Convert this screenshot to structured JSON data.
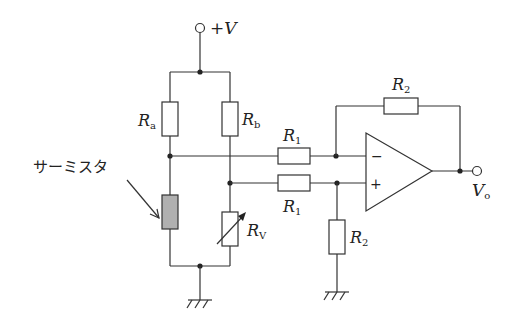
{
  "diagram": {
    "type": "thermistor bridge with differential amplifier",
    "supply": {
      "label": "+V"
    },
    "output": {
      "label_main": "V",
      "label_sub": "o"
    },
    "thermistor": {
      "label": "サーミスタ",
      "fill_color": "#b0b0b0"
    },
    "resistors": {
      "ra": {
        "main": "R",
        "sub": "a"
      },
      "rb": {
        "main": "R",
        "sub": "b"
      },
      "rv": {
        "main": "R",
        "sub": "V"
      },
      "r1_top": {
        "main": "R",
        "sub": "1"
      },
      "r1_bottom": {
        "main": "R",
        "sub": "1"
      },
      "r2_feedback": {
        "main": "R",
        "sub": "2"
      },
      "r2_ground": {
        "main": "R",
        "sub": "2"
      }
    },
    "opamp": {
      "inverting": "−",
      "non_inverting": "+"
    }
  }
}
